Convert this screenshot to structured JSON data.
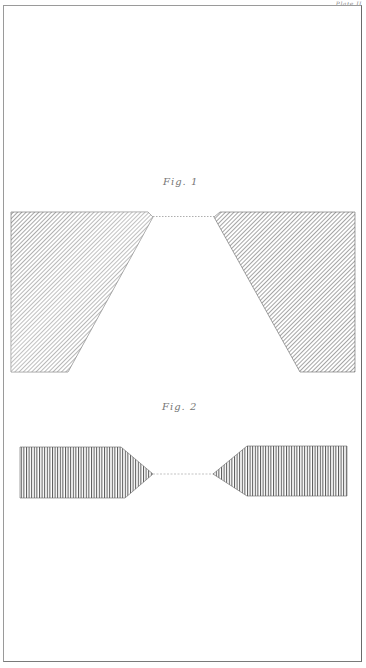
{
  "plate": {
    "label": "Plate II"
  },
  "figures": [
    {
      "id": "fig-1",
      "label": "Fig. 1",
      "hatch": "diagonal",
      "left_shape": "trapezoid-with-pointed-inner-corner",
      "right_shape": "trapezoid-with-pointed-inner-corner",
      "connector": "dotted-line"
    },
    {
      "id": "fig-2",
      "label": "Fig. 2",
      "hatch": "vertical",
      "left_shape": "pentagon-arrow-pointing-right",
      "right_shape": "pentagon-arrow-pointing-left",
      "connector": "dotted-line"
    }
  ],
  "colors": {
    "paper": "#ffffff",
    "ink": "#4a4a4a",
    "ink_light": "#8a8a8a",
    "frame": "#9a9a9a"
  }
}
